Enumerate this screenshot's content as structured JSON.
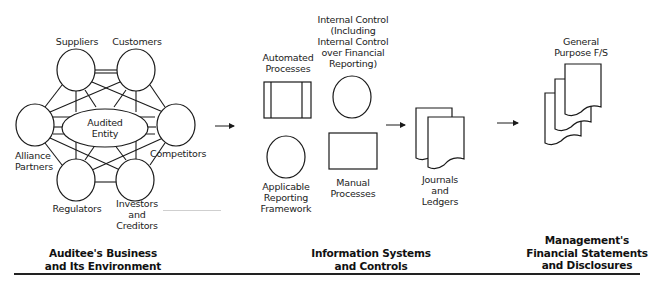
{
  "sections": {
    "business": {
      "caption": [
        "Auditee's Business",
        "and Its Environment"
      ],
      "center": [
        "Audited",
        "Entity"
      ],
      "nodes": {
        "suppliers": "Suppliers",
        "customers": "Customers",
        "alliance": [
          "Alliance",
          "Partners"
        ],
        "competitors": "Competitors",
        "regulators": "Regulators",
        "investors": [
          "Investors",
          "and",
          "Creditors"
        ]
      }
    },
    "systems": {
      "caption": [
        "Information Systems",
        "and Controls"
      ],
      "automated": [
        "Automated",
        "Processes"
      ],
      "internal_control": [
        "Internal Control",
        "(Including",
        "Internal Control",
        "over Financial",
        "Reporting)"
      ],
      "applicable": [
        "Applicable",
        "Reporting",
        "Framework"
      ],
      "manual": [
        "Manual",
        "Processes"
      ],
      "journals": [
        "Journals",
        "and",
        "Ledgers"
      ]
    },
    "statements": {
      "caption": [
        "Management's",
        "Financial Statements",
        "and Disclosures"
      ],
      "general": [
        "General",
        "Purpose F/S"
      ]
    }
  },
  "colors": {
    "stroke": "#1a1a1a",
    "background": "#ffffff"
  }
}
